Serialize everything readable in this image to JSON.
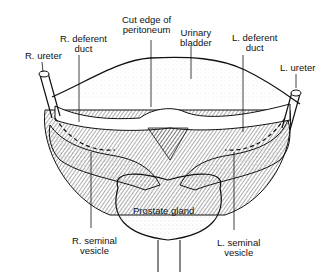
{
  "diagram": {
    "labels": {
      "r_ureter": "R. ureter",
      "r_deferent_duct_1": "R. deferent",
      "r_deferent_duct_2": "duct",
      "cut_edge_1": "Cut edge of",
      "cut_edge_2": "peritoneum",
      "urinary_bladder_1": "Urinary",
      "urinary_bladder_2": "bladder",
      "l_deferent_duct_1": "L. deferent",
      "l_deferent_duct_2": "duct",
      "l_ureter": "L. ureter",
      "prostate": "Prostate gland",
      "r_seminal_1": "R. seminal",
      "r_seminal_2": "vesicle",
      "l_seminal_1": "L. seminal",
      "l_seminal_2": "vesicle"
    }
  }
}
